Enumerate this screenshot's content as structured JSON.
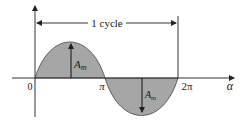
{
  "diagram": {
    "type": "sine-wave",
    "cycle_label": "1 cycle",
    "origin_label": "0",
    "pi_label": "π",
    "two_pi_label": "2π",
    "x_axis_label": "α",
    "amp_label_main": "A",
    "amp_label_sub": "m",
    "colors": {
      "fill": "#a6a6a6",
      "stroke": "#333333"
    }
  }
}
